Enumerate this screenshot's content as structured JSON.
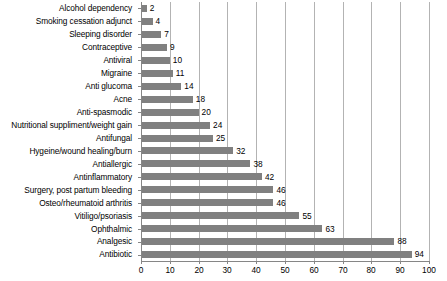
{
  "chart_data": {
    "type": "bar",
    "orientation": "horizontal",
    "title": "",
    "subtitle": "",
    "xlabel": "",
    "ylabel": "",
    "xlim": [
      0,
      100
    ],
    "xticks": [
      0,
      10,
      20,
      30,
      40,
      50,
      60,
      70,
      80,
      90,
      100
    ],
    "grid": "vertical",
    "legend": "none",
    "bar_color": "#808080",
    "gridline_color": "#b3b3b3",
    "axis_color": "#868686",
    "categories": [
      "Alcohol dependency",
      "Smoking cessation adjunct",
      "Sleeping disorder",
      "Contraceptive",
      "Antiviral",
      "Migraine",
      "Anti glucoma",
      "Acne",
      "Anti-spasmodic",
      "Nutritional suppliment/weight gain",
      "Antifungal",
      "Hygeine/wound healing/burn",
      "Antiallergic",
      "Antinflammatory",
      "Surgery, post partum bleeding",
      "Osteo/rheumatoid arthritis",
      "Vitiligo/psoriasis",
      "Ophthalmic",
      "Analgesic",
      "Antibiotic"
    ],
    "values": [
      2,
      4,
      7,
      9,
      10,
      11,
      14,
      18,
      20,
      24,
      25,
      32,
      38,
      42,
      46,
      46,
      55,
      63,
      88,
      94
    ],
    "data_labels": [
      "2",
      "4",
      "7",
      "9",
      "10",
      "11",
      "14",
      "18",
      "20",
      "24",
      "25",
      "32",
      "38",
      "42",
      "46",
      "46",
      "55",
      "63",
      "88",
      "94"
    ],
    "xtick_labels": [
      "0",
      "10",
      "20",
      "30",
      "40",
      "50",
      "60",
      "70",
      "80",
      "90",
      "100"
    ]
  }
}
